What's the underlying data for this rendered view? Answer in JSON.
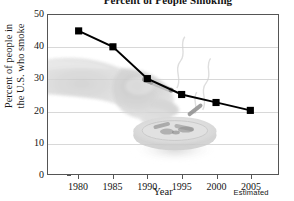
{
  "chart_data": {
    "type": "line",
    "title": "Percent of People Smoking",
    "xlabel": "Year",
    "ylabel_line1": "Percent of people in",
    "ylabel_line2": "the U.S. who smoke",
    "categories": [
      "1980",
      "1985",
      "1990",
      "1995",
      "2000",
      "2005"
    ],
    "x": [
      1980,
      1985,
      1990,
      1995,
      2000,
      2005
    ],
    "values": [
      45,
      40,
      30,
      25,
      22.5,
      20
    ],
    "series": [
      {
        "name": "Percent of people in the U.S. who smoke",
        "values": [
          45,
          40,
          30,
          25,
          22.5,
          20
        ]
      }
    ],
    "xlim": [
      1978,
      2007
    ],
    "ylim": [
      0,
      50
    ],
    "ytick_labels": [
      "0",
      "10",
      "20",
      "30",
      "40",
      "50"
    ],
    "ytick_values": [
      0,
      10,
      20,
      30,
      40,
      50
    ],
    "xtick_labels": [
      "1980",
      "1985",
      "1990",
      "1995",
      "2000",
      "2005"
    ],
    "grid": true,
    "legend": "none",
    "annotation": "Estimated",
    "annotation_at": "2005",
    "marker": "square",
    "line_color": "#000000",
    "marker_color": "#000000",
    "grid_color": "#d8d8d8",
    "axis_color": "#555555",
    "background_color": "#ffffff",
    "watermark": "grayscale photo of a hand holding a cigarette over an ashtray"
  }
}
